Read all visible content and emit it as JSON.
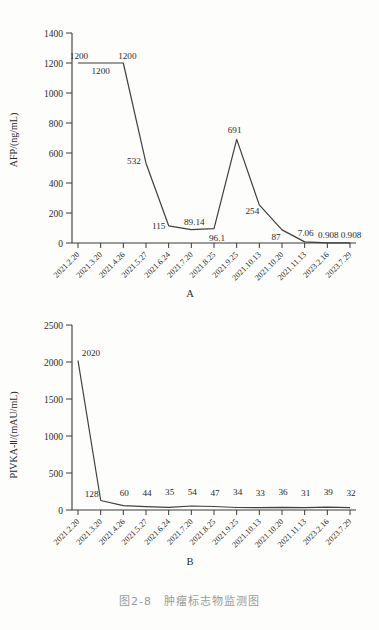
{
  "figure": {
    "caption": "图2-8　肿瘤标志物监测图",
    "panel_a_letter": "A",
    "panel_b_letter": "B"
  },
  "chart_data": [
    {
      "type": "line",
      "panel": "A",
      "title": "",
      "xlabel": "",
      "ylabel": "AFP/(ng/mL)",
      "ylim": [
        0,
        1400
      ],
      "yticks": [
        0,
        200,
        400,
        600,
        800,
        1000,
        1200,
        1400
      ],
      "grid": false,
      "legend": "none",
      "categories": [
        "2021.2.20",
        "2021.3.20",
        "2021.4.26",
        "2021.5.27",
        "2021.6.24",
        "2021.7.20",
        "2021.8.25",
        "2021.9.25",
        "2021.10.13",
        "2021.10.20",
        "2021.11.13",
        "2023.2.16",
        "2023.7.29"
      ],
      "values": [
        1200,
        1200,
        1200,
        532,
        115,
        89.14,
        96.1,
        691,
        254,
        87,
        7.06,
        0.908,
        0.908
      ],
      "point_labels": [
        "1200",
        "1200",
        "1200",
        "532",
        "115",
        "89.14",
        "96.1",
        "691",
        "254",
        "87",
        "7.06",
        "0.908",
        "0.908"
      ]
    },
    {
      "type": "line",
      "panel": "B",
      "title": "",
      "xlabel": "",
      "ylabel": "PIVKA-Ⅱ/(mAU/mL)",
      "ylim": [
        0,
        2500
      ],
      "yticks": [
        0,
        500,
        1000,
        1500,
        2000,
        2500
      ],
      "grid": false,
      "legend": "none",
      "categories": [
        "2021.2.20",
        "2021.3.20",
        "2021.4.26",
        "2021.5.27",
        "2021.6.24",
        "2021.7.20",
        "2021.8.25",
        "2021.9.25",
        "2021.10.13",
        "2021.10.20",
        "2021.11.13",
        "2023.2.16",
        "2023.7.29"
      ],
      "values": [
        2020,
        128,
        60,
        44,
        35,
        54,
        47,
        34,
        33,
        36,
        31,
        39,
        32
      ],
      "point_labels": [
        "2020",
        "128",
        "60",
        "44",
        "35",
        "54",
        "47",
        "34",
        "33",
        "36",
        "31",
        "39",
        "32"
      ]
    }
  ],
  "axis_a": {
    "ylabel": "AFP/(ng/mL)",
    "yticks": [
      "1400",
      "1200",
      "1000",
      "800",
      "600",
      "400",
      "200",
      "0"
    ]
  },
  "axis_b": {
    "ylabel": "PIVKA-Ⅱ/(mAU/mL)",
    "yticks": [
      "2500",
      "2000",
      "1500",
      "1000",
      "500",
      "0"
    ]
  },
  "colors": {
    "line": "#3f3f3f",
    "axis": "#3a3a3a",
    "text": "#2b2b2b",
    "caption": "#9a9a9a",
    "background": "#fdfdfb"
  }
}
